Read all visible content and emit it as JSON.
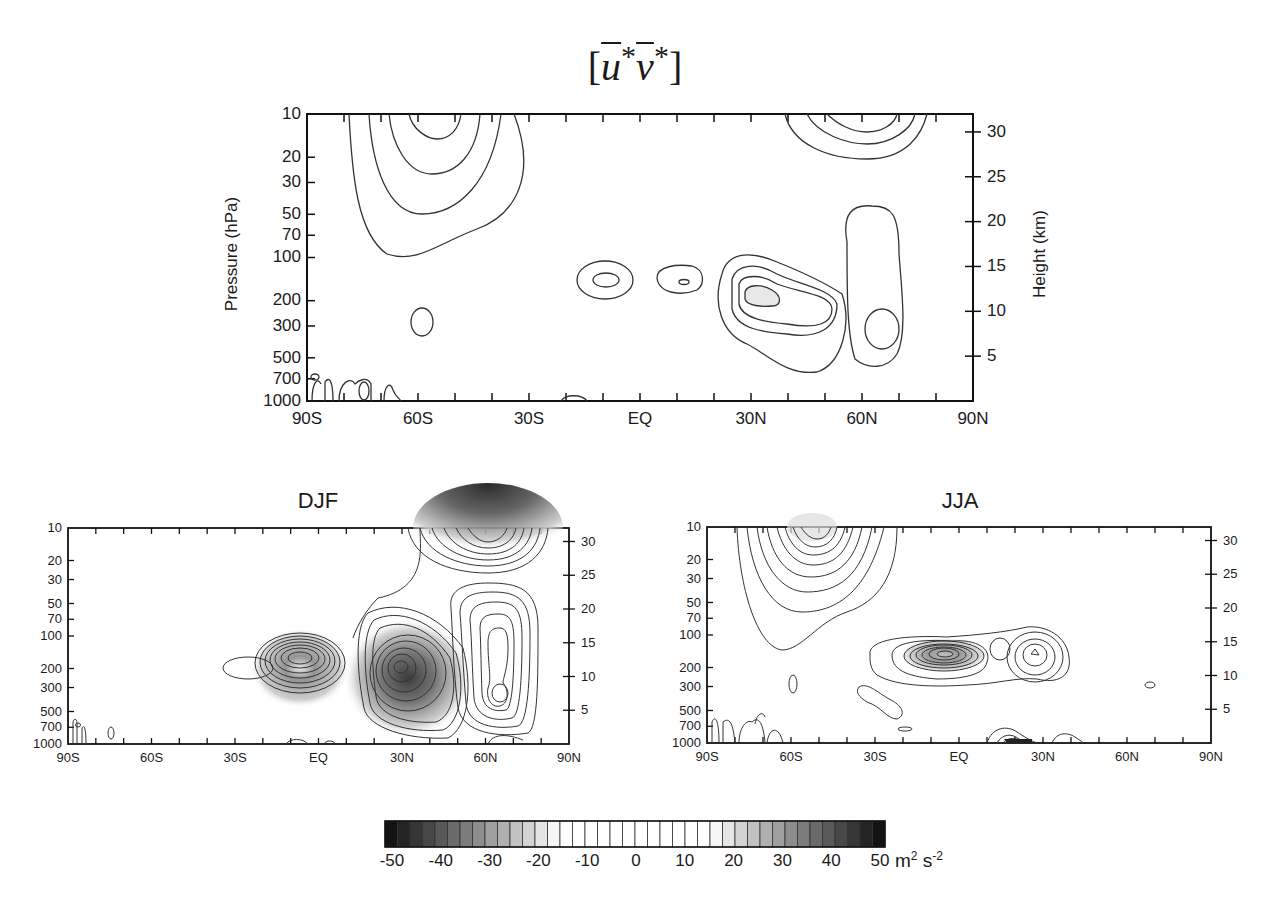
{
  "figure": {
    "title_base": "[u*v*]",
    "title_parts": {
      "open": "[",
      "u": "u",
      "star1": "*",
      "v": "v",
      "star2": "*",
      "close": "]"
    }
  },
  "chart_data": [
    {
      "type": "heatmap",
      "subtype": "contour",
      "panel": "annual",
      "title": "[ū*v̄*]",
      "xlabel": "",
      "ylabel": "Pressure  (hPa)",
      "ylabel_right": "Height (km)",
      "x_ticks": [
        "90S",
        "60S",
        "30S",
        "EQ",
        "30N",
        "60N",
        "90N"
      ],
      "y_ticks": [
        "10",
        "20",
        "30",
        "50",
        "70",
        "100",
        "200",
        "300",
        "500",
        "700",
        "1000"
      ],
      "y_ticks_right": [
        "30",
        "25",
        "20",
        "15",
        "10",
        "5"
      ],
      "xlim": [
        "90S",
        "90N"
      ],
      "ylim_hPa": [
        1000,
        10
      ],
      "features": [
        {
          "lat": "60S",
          "p_hPa": 10,
          "type": "stratospheric max",
          "contours": 5
        },
        {
          "lat": "55S",
          "p_hPa": 280,
          "type": "small closed contour",
          "contours": 1
        },
        {
          "lat": "10S",
          "p_hPa": 150,
          "type": "closed contour",
          "contours": 2
        },
        {
          "lat": "10N",
          "p_hPa": 150,
          "type": "closed contour",
          "contours": 2
        },
        {
          "lat": "35N",
          "p_hPa": 220,
          "type": "jet-level max",
          "contours": 4
        },
        {
          "lat": "62N",
          "p_hPa": 280,
          "type": "elongated contour",
          "contours": 2
        },
        {
          "lat": "60N",
          "p_hPa": 10,
          "type": "stratospheric max",
          "contours": 3
        }
      ]
    },
    {
      "type": "heatmap",
      "subtype": "contour",
      "panel": "DJF",
      "title": "DJF",
      "x_ticks": [
        "90S",
        "60S",
        "30S",
        "EQ",
        "30N",
        "60N",
        "90N"
      ],
      "y_ticks": [
        "10",
        "20",
        "30",
        "50",
        "70",
        "100",
        "200",
        "300",
        "500",
        "700",
        "1000"
      ],
      "y_ticks_right": [
        "30",
        "25",
        "20",
        "15",
        "10",
        "5"
      ],
      "features": [
        {
          "lat": "30S",
          "p_hPa": 200,
          "type": "closed contour",
          "contours": 1
        },
        {
          "lat": "5N",
          "p_hPa": 150,
          "type": "max",
          "contours": 11
        },
        {
          "lat": "30N",
          "p_hPa": 200,
          "type": "strong max",
          "contours": 20
        },
        {
          "lat": "60N",
          "p_hPa": 250,
          "type": "elongated max",
          "contours": 7
        },
        {
          "lat": "60N",
          "p_hPa": 10,
          "type": "strong stratospheric max",
          "contours": 25
        }
      ]
    },
    {
      "type": "heatmap",
      "subtype": "contour",
      "panel": "JJA",
      "title": "JJA",
      "x_ticks": [
        "90S",
        "60S",
        "30S",
        "EQ",
        "30N",
        "60N",
        "90N"
      ],
      "y_ticks": [
        "10",
        "20",
        "30",
        "50",
        "70",
        "100",
        "200",
        "300",
        "500",
        "700",
        "1000"
      ],
      "y_ticks_right": [
        "30",
        "25",
        "20",
        "15",
        "10",
        "5"
      ],
      "features": [
        {
          "lat": "55S",
          "p_hPa": 10,
          "type": "stratospheric max",
          "contours": 10
        },
        {
          "lat": "5S",
          "p_hPa": 160,
          "type": "max",
          "contours": 12
        },
        {
          "lat": "30N",
          "p_hPa": 170,
          "type": "max",
          "contours": 5
        },
        {
          "lat": "25S",
          "p_hPa": 400,
          "type": "elongated contour",
          "contours": 1
        },
        {
          "lat": "70N",
          "p_hPa": 300,
          "type": "small contour",
          "contours": 1
        }
      ]
    }
  ],
  "panels": {
    "top": {
      "ylabel": "Pressure  (hPa)",
      "ylabel_right": "Height (km)",
      "x_ticks": [
        "90S",
        "60S",
        "30S",
        "EQ",
        "30N",
        "60N",
        "90N"
      ],
      "y_ticks": [
        "10",
        "20",
        "30",
        "50",
        "70",
        "100",
        "200",
        "300",
        "500",
        "700",
        "1000"
      ],
      "y_ticks_right": [
        "30",
        "25",
        "20",
        "15",
        "10",
        "5"
      ]
    },
    "djf": {
      "title": "DJF",
      "x_ticks": [
        "90S",
        "60S",
        "30S",
        "EQ",
        "30N",
        "60N",
        "90N"
      ],
      "y_ticks": [
        "10",
        "20",
        "30",
        "50",
        "70",
        "100",
        "200",
        "300",
        "500",
        "700",
        "1000"
      ],
      "y_ticks_right": [
        "30",
        "25",
        "20",
        "15",
        "10",
        "5"
      ]
    },
    "jja": {
      "title": "JJA",
      "x_ticks": [
        "90S",
        "60S",
        "30S",
        "EQ",
        "30N",
        "60N",
        "90N"
      ],
      "y_ticks": [
        "10",
        "20",
        "30",
        "50",
        "70",
        "100",
        "200",
        "300",
        "500",
        "700",
        "1000"
      ],
      "y_ticks_right": [
        "30",
        "25",
        "20",
        "15",
        "10",
        "5"
      ]
    }
  },
  "colorbar": {
    "labels": [
      "-50",
      "-40",
      "-30",
      "-20",
      "-10",
      "0",
      "10",
      "20",
      "30",
      "40",
      "50"
    ],
    "unit_base": "m",
    "unit_exp1": "2",
    "unit_mid": " s",
    "unit_exp2": "-2",
    "range": [
      -50,
      50
    ],
    "n_cells": 40,
    "colors": {
      "extreme": "#0a0a0a",
      "center": "#ffffff"
    }
  }
}
